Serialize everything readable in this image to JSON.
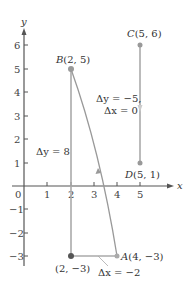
{
  "axes": {
    "x_label": "x",
    "y_label": "y",
    "origin_label": "0",
    "x_ticks": [
      "1",
      "2",
      "3",
      "4",
      "5"
    ],
    "y_ticks": [
      "6",
      "5",
      "4",
      "3",
      "2",
      "1",
      "−1",
      "−2",
      "−3"
    ]
  },
  "points": {
    "A": {
      "label": "A(4, −3)",
      "x": 4,
      "y": -3
    },
    "B": {
      "label": "B(2, 5)",
      "x": 2,
      "y": 5
    },
    "C": {
      "label": "C(5, 6)",
      "x": 5,
      "y": 6
    },
    "D": {
      "label": "D(5, 1)",
      "x": 5,
      "y": 1
    },
    "corner": {
      "label": "(2, −3)",
      "x": 2,
      "y": -3
    }
  },
  "annotations": {
    "delta_y_ab": "Δy = 8",
    "delta_x_ab": "Δx = −2",
    "delta_y_cd": "Δy = −5,",
    "delta_x_cd": "Δx = 0"
  },
  "colors": {
    "axis": "#555555",
    "segment": "#999999",
    "point": "#888888",
    "corner_point": "#555555"
  }
}
